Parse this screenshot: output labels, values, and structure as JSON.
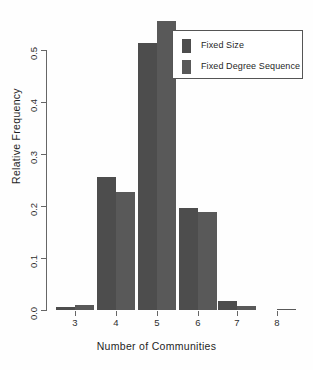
{
  "chart_data": {
    "type": "bar",
    "title": "",
    "xlabel": "Number of Communities",
    "ylabel": "Relative Frequency",
    "categories": [
      "3",
      "4",
      "5",
      "6",
      "7",
      "8"
    ],
    "xtick_labels": [
      "3",
      "4",
      "5",
      "6",
      "7",
      "8"
    ],
    "ytick_labels": [
      "0.0",
      "0.1",
      "0.2",
      "0.3",
      "0.4",
      "0.5"
    ],
    "ytick_values": [
      0.0,
      0.1,
      0.2,
      0.3,
      0.4,
      0.5
    ],
    "ylim": [
      0.0,
      0.565
    ],
    "grid": false,
    "legend_position": "top-right",
    "series": [
      {
        "name": "Fixed Size",
        "color": "#4d4d4d",
        "values": [
          0.005,
          0.256,
          0.513,
          0.197,
          0.018,
          0.0
        ]
      },
      {
        "name": "Fixed Degree Sequence",
        "color": "#595959",
        "values": [
          0.01,
          0.226,
          0.556,
          0.188,
          0.007,
          0.002
        ]
      }
    ]
  },
  "legend": {
    "items": [
      {
        "label": "Fixed Size",
        "color": "#4d4d4d"
      },
      {
        "label": "Fixed Degree Sequence",
        "color": "#595959"
      }
    ]
  },
  "axes": {
    "x_title": "Number of Communities",
    "y_title": "Relative Frequency"
  },
  "colors": {
    "background": "#fefefe",
    "axis": "#666666",
    "text": "#1f1f1f",
    "series_1": "#4d4d4d",
    "series_2": "#595959"
  }
}
